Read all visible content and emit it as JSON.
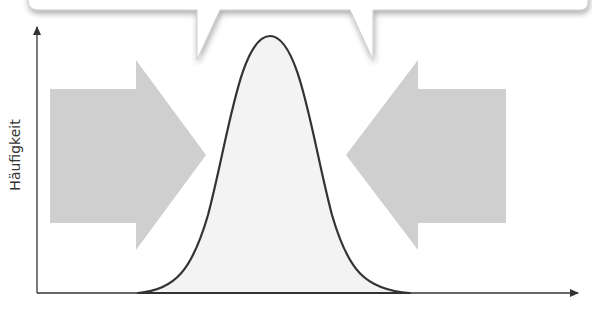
{
  "diagram": {
    "type": "normal-distribution-compression",
    "y_axis": {
      "label": "Häufigkeit"
    },
    "x_axis": {
      "label": ""
    },
    "callout": {
      "text": ""
    },
    "arrows": [
      {
        "direction": "right",
        "position": "left"
      },
      {
        "direction": "left",
        "position": "right"
      }
    ],
    "curve": {
      "shape": "bell-curve",
      "fill": "#f3f3f3",
      "stroke": "#333333"
    },
    "colors": {
      "arrow_fill": "#cfcfcf",
      "axis": "#333333",
      "callout_fill": "#ffffff",
      "callout_shadow": "#bdbdbd",
      "background": "#ffffff"
    }
  }
}
